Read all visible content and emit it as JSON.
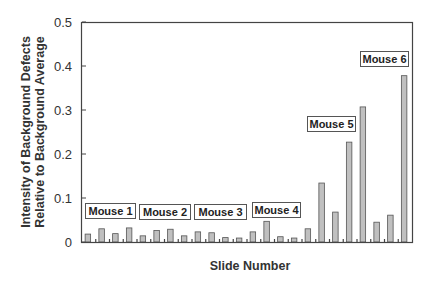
{
  "chart_data": {
    "type": "bar",
    "title": "",
    "xlabel": "Slide Number",
    "ylabel": [
      "Intensity of Background Defects",
      "Relative to Background Average"
    ],
    "ylim": [
      0,
      0.5
    ],
    "yticks": [
      "0",
      "0.1",
      "0.2",
      "0.3",
      "0.4",
      "0.5"
    ],
    "ytick_values": [
      0,
      0.1,
      0.2,
      0.3,
      0.4,
      0.5
    ],
    "grid": false,
    "legend": null,
    "categories": [
      1,
      2,
      3,
      4,
      5,
      6,
      7,
      8,
      9,
      10,
      11,
      12,
      13,
      14,
      15,
      16,
      17,
      18,
      19,
      20,
      21,
      22,
      23,
      24
    ],
    "values": [
      0.018,
      0.03,
      0.019,
      0.032,
      0.014,
      0.026,
      0.029,
      0.014,
      0.023,
      0.021,
      0.01,
      0.009,
      0.023,
      0.047,
      0.012,
      0.009,
      0.03,
      0.134,
      0.068,
      0.227,
      0.307,
      0.045,
      0.061,
      0.378
    ],
    "bar_color": "#c0c0c0",
    "annotations": [
      {
        "text": "Mouse 1",
        "x": 85,
        "y": 203,
        "w": 50
      },
      {
        "text": "Mouse 2",
        "x": 139,
        "y": 204,
        "w": 51
      },
      {
        "text": "Mouse 3",
        "x": 194,
        "y": 204,
        "w": 52
      },
      {
        "text": "Mouse 4",
        "x": 252,
        "y": 202,
        "w": 48
      },
      {
        "text": "Mouse 5",
        "x": 307,
        "y": 116,
        "w": 48
      },
      {
        "text": "Mouse 6",
        "x": 360,
        "y": 51,
        "w": 48
      }
    ]
  }
}
